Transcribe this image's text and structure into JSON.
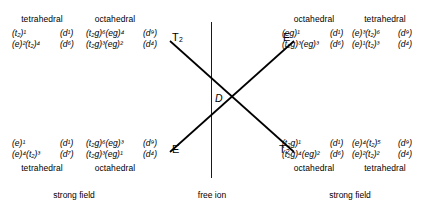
{
  "diagram": {
    "center_term": "D",
    "free_ion_caption": "free ion",
    "strong_field_caption_left": "strong field",
    "strong_field_caption_right": "strong field",
    "branch_labels": {
      "top_left": "T₂",
      "top_right": "E",
      "bottom_left": "E",
      "bottom_right": "T₂"
    },
    "quadrants": {
      "top_left": {
        "headers": [
          "tetrahedral",
          "octahedral"
        ],
        "tetrahedral": [
          {
            "config": "(t₂)¹",
            "dterm": "(d¹)"
          },
          {
            "config": "(e)²(t₂)⁴",
            "dterm": "(d⁶)"
          }
        ],
        "octahedral": [
          {
            "config": "(t₂g)⁶(eg)⁴",
            "dterm": "(d⁹)"
          },
          {
            "config": "(t₂g)³(eg)²",
            "dterm": "(d⁴)"
          }
        ]
      },
      "top_right": {
        "headers": [
          "octahedral",
          "tetrahedral"
        ],
        "octahedral": [
          {
            "config": "(eg)¹",
            "dterm": "(d¹)"
          },
          {
            "config": "(t₂g)³(eg)³",
            "dterm": "(d⁶)"
          }
        ],
        "tetrahedral": [
          {
            "config": "(e)³(t₂)⁶",
            "dterm": "(d⁹)"
          },
          {
            "config": "(e)¹(t₂)³",
            "dterm": "(d⁴)"
          }
        ]
      },
      "bottom_left": {
        "headers": [
          "tetrahedral",
          "octahedral"
        ],
        "tetrahedral": [
          {
            "config": "(e)¹",
            "dterm": "(d¹)"
          },
          {
            "config": "(e)⁴(t₂)³",
            "dterm": "(d⁷)"
          }
        ],
        "octahedral": [
          {
            "config": "(t₂g)⁶(eg)³",
            "dterm": "(d⁹)"
          },
          {
            "config": "(t₂g)³(eg)¹",
            "dterm": "(d⁴)"
          }
        ]
      },
      "bottom_right": {
        "headers": [
          "octahedral",
          "tetrahedral"
        ],
        "octahedral": [
          {
            "config": "(t₂g)¹",
            "dterm": "(d¹)"
          },
          {
            "config": "(t₂g)⁴(eg)²",
            "dterm": "(d⁶)"
          }
        ],
        "tetrahedral": [
          {
            "config": "(e)⁴(t₂)⁵",
            "dterm": "(d⁹)"
          },
          {
            "config": "(e)²(t₂)²",
            "dterm": "(d⁴)"
          }
        ]
      }
    },
    "colors": {
      "line": "#000000",
      "text": "#000000",
      "background": "#ffffff"
    }
  }
}
